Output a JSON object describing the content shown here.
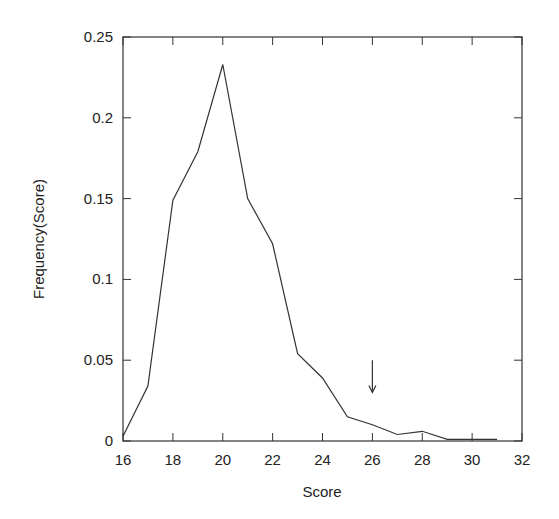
{
  "chart_data": {
    "type": "line",
    "title": "",
    "xlabel": "Score",
    "ylabel": "Frequency(Score)",
    "xlim": [
      16,
      32
    ],
    "ylim": [
      0,
      0.25
    ],
    "grid": false,
    "legend": null,
    "x_ticks": [
      16,
      18,
      20,
      22,
      24,
      26,
      28,
      30,
      32
    ],
    "x_tick_labels": [
      "16",
      "18",
      "20",
      "22",
      "24",
      "26",
      "28",
      "30",
      "32"
    ],
    "y_ticks": [
      0,
      0.05,
      0.1,
      0.15,
      0.2,
      0.25
    ],
    "y_tick_labels": [
      "0",
      "0.05",
      "0.1",
      "0.15",
      "0.2",
      "0.25"
    ],
    "series": [
      {
        "name": "Frequency",
        "color": "#333333",
        "x": [
          16,
          17,
          18,
          19,
          20,
          21,
          22,
          23,
          24,
          25,
          26,
          27,
          28,
          29,
          30,
          31
        ],
        "y": [
          0.003,
          0.034,
          0.149,
          0.179,
          0.233,
          0.15,
          0.122,
          0.054,
          0.039,
          0.015,
          0.01,
          0.004,
          0.006,
          0.001,
          0.001,
          0.001
        ]
      }
    ],
    "annotations": [
      {
        "type": "arrow",
        "x": 26,
        "y_from": 0.05,
        "y_to": 0.03,
        "direction": "down"
      }
    ]
  }
}
